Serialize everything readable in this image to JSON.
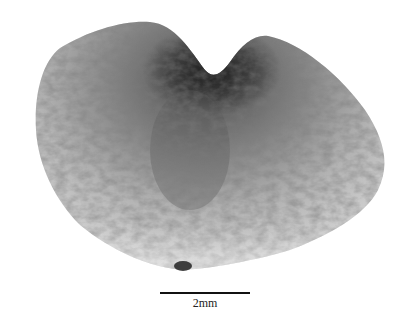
{
  "image": {
    "subject": "seed specimen micrograph",
    "background": "#ffffff"
  },
  "scale_bar": {
    "label": "2mm"
  }
}
